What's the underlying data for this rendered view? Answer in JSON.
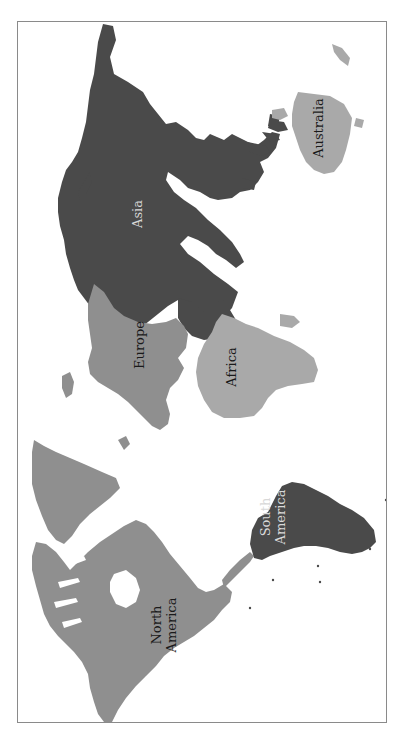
{
  "map": {
    "orientation": "rotated 90deg counter-clockwise (north points left)",
    "colors": {
      "dark": "#4a4a4a",
      "medium": "#8f8f8f",
      "light": "#a9a9a9",
      "frame": "#8a8a8a",
      "background": "#ffffff"
    },
    "continents": [
      {
        "id": "asia",
        "label": "Asia",
        "shade": "dark"
      },
      {
        "id": "australia",
        "label": "Australia",
        "shade": "light"
      },
      {
        "id": "europe",
        "label": "Europe",
        "shade": "medium"
      },
      {
        "id": "africa",
        "label": "Africa",
        "shade": "light"
      },
      {
        "id": "north-america",
        "label": "North\nAmerica",
        "shade": "medium"
      },
      {
        "id": "south-america",
        "label": "South\nAmerica",
        "shade": "dark"
      }
    ]
  }
}
